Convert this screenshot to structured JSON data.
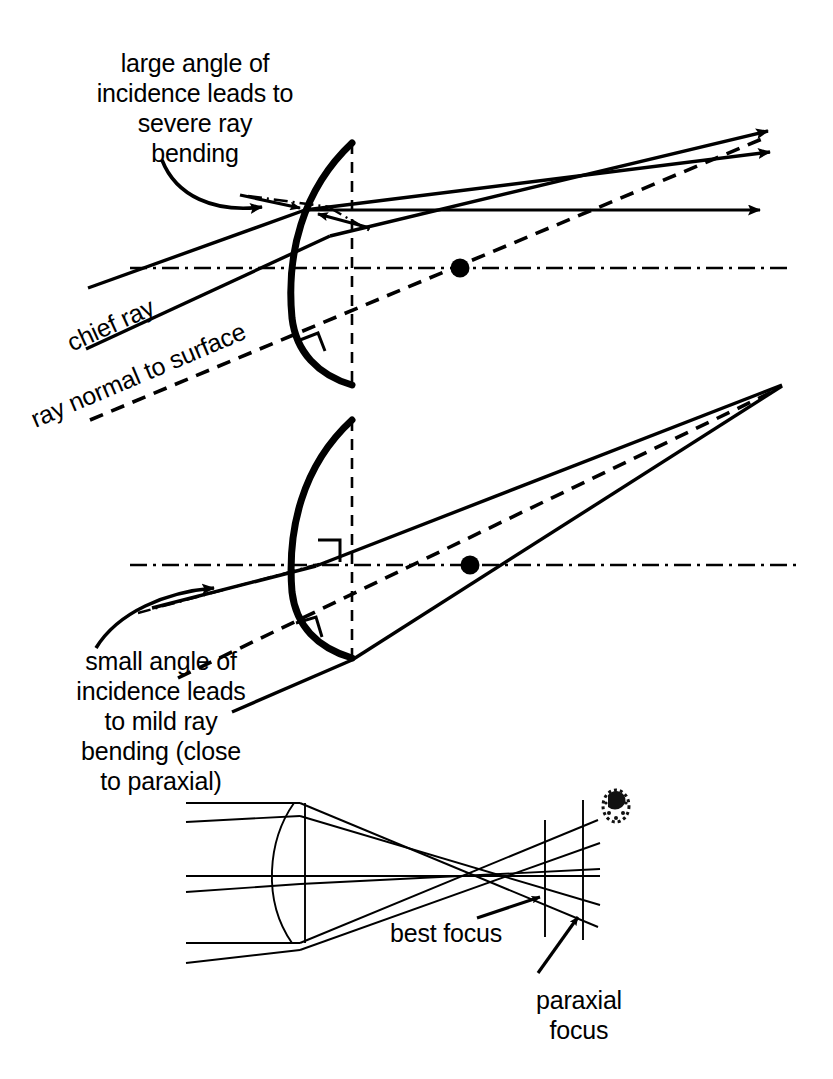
{
  "figure": {
    "ink_color": "#000000",
    "background": "#ffffff"
  },
  "labels": {
    "top_callout": "large angle of\nincidence leads to\nsevere ray\nbending",
    "chief_ray": "chief ray",
    "ray_normal": "ray normal to surface",
    "bottom_callout": "small angle of\nincidence leads\nto mild ray\nbending (close\nto paraxial)",
    "best_focus": "best focus",
    "paraxial_focus": "paraxial\nfocus"
  },
  "panels": [
    {
      "id": "panel-large-angle",
      "name": "large-angle-of-incidence-diagram",
      "description": "Curved refracting surface with steeply inclined chief ray; rays diverge after the surface",
      "axis_y": 268,
      "center_of_curvature": {
        "x": 460,
        "y": 268
      },
      "surface_vertex": {
        "x": 350,
        "y": 268
      },
      "incidence_point": {
        "x": 305,
        "y": 210
      }
    },
    {
      "id": "panel-small-angle",
      "name": "small-angle-of-incidence-diagram",
      "description": "Same surface with a shallow chief ray; rays converge near the paraxial focus",
      "axis_y": 565,
      "center_of_curvature": {
        "x": 470,
        "y": 565
      },
      "surface_vertex": {
        "x": 350,
        "y": 565
      },
      "convergence_point": {
        "x": 782,
        "y": 385
      }
    },
    {
      "id": "panel-spot",
      "name": "spherical-aberration-ray-fan-diagram",
      "description": "Full ray fan through a lens showing best focus ahead of paraxial focus",
      "axis_y": 876,
      "lens_left": 270,
      "lens_right": 305,
      "best_focus_x": 545,
      "paraxial_focus_x": 583
    }
  ],
  "line_styles": {
    "ray": "solid",
    "normal": "dashed",
    "optical_axis": "dash-dot",
    "surface": "thick-solid"
  },
  "markers": {
    "right_angle_symbol": "square",
    "center_dot": "filled-circle",
    "arrowhead": "solid-triangle"
  },
  "artifact": {
    "name": "scan-speckle",
    "x": 615,
    "y": 805
  }
}
